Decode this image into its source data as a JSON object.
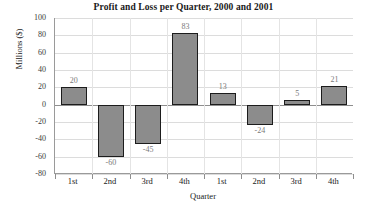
{
  "chart_data": {
    "type": "bar",
    "title": "Profit and Loss per Quarter, 2000 and 2001",
    "xlabel": "Quarter",
    "ylabel": "Millions ($)",
    "categories": [
      "1st",
      "2nd",
      "3rd",
      "4th",
      "1st",
      "2nd",
      "3rd",
      "4th"
    ],
    "values": [
      20,
      -60,
      -45,
      83,
      13,
      -24,
      5,
      21
    ],
    "value_labels": [
      "20",
      "-60",
      "-45",
      "83",
      "13",
      "-24",
      "5",
      "21"
    ],
    "ylim": [
      -80,
      100
    ],
    "yticks": [
      100,
      80,
      60,
      40,
      20,
      0,
      -20,
      -40,
      -60,
      -80
    ],
    "ytick_labels": [
      "100",
      "80",
      "60",
      "40",
      "20",
      "0",
      "-20",
      "-40",
      "-60",
      "-80"
    ],
    "grid": true,
    "legend": "none",
    "bar_color": "#8c8c8c",
    "bar_edge_color": "#1c1c1c",
    "gridline_color": "#dcdcdc",
    "axis_color": "#8e8e8e",
    "label_color": "#7a7a7a"
  }
}
